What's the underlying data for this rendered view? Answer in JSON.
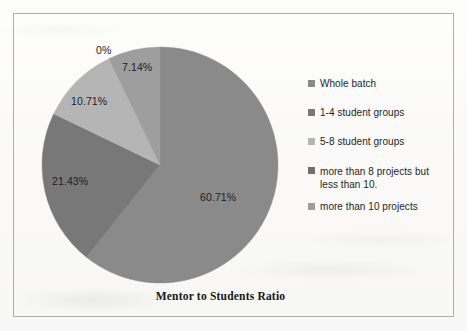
{
  "chart_data": {
    "type": "pie",
    "title": "Mentor to Students Ratio",
    "categories": [
      "Whole batch",
      "1-4 student groups",
      "5-8 student groups",
      "more than 8 projects but less than 10.",
      "more than 10 projects"
    ],
    "values": [
      60.71,
      21.43,
      10.71,
      0,
      7.14
    ],
    "value_labels": [
      "60.71%",
      "21.43%",
      "10.71%",
      "0%",
      "7.14%"
    ],
    "unit": "percent",
    "legend_position": "right",
    "grid": false,
    "colors": [
      "#8a8a8a",
      "#787878",
      "#b5b5b5",
      "#6f6f6f",
      "#9e9e9e"
    ],
    "start_angle_deg": 0,
    "direction": "clockwise"
  },
  "frame": {
    "border_color": "#adadad"
  },
  "labels": {
    "zero": "0%",
    "seven": "7.14%",
    "ten": "10.71%",
    "twentyone": "21.43%",
    "sixty": "60.71%"
  },
  "legend": {
    "items": [
      {
        "label": "Whole batch",
        "color": "#8a8a8a"
      },
      {
        "label": "1-4 student groups",
        "color": "#787878"
      },
      {
        "label": "5-8 student groups",
        "color": "#b5b5b5"
      },
      {
        "label": "more than 8 projects but less than 10.",
        "color": "#6f6f6f"
      },
      {
        "label": "more than 10 projects",
        "color": "#9e9e9e"
      }
    ]
  },
  "title": {
    "text": "Mentor to Students Ratio"
  }
}
